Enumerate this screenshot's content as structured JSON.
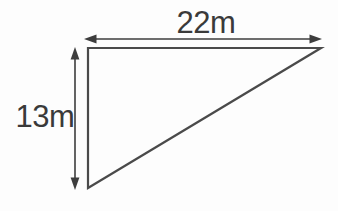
{
  "figure": {
    "type": "right-triangle-dimension-diagram",
    "width_label": "22m",
    "height_label": "13m",
    "colors": {
      "line": "#4a4a4a",
      "arrow": "#3d3d3d",
      "text": "#3a3a3a",
      "background": "#fdfdfd"
    }
  }
}
